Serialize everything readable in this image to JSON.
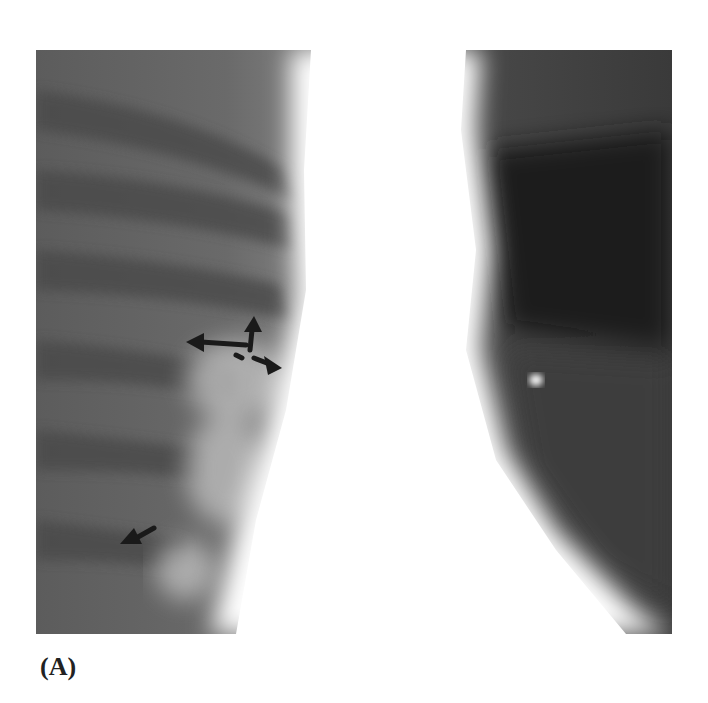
{
  "figure": {
    "panel_label": "(A)",
    "image_type": "chest radiograph",
    "annotations": [
      {
        "name": "arrow-left-hilum",
        "direction": "left"
      },
      {
        "name": "arrow-up-hilum",
        "direction": "up"
      },
      {
        "name": "arrow-down-right-hilum",
        "direction": "down-right"
      },
      {
        "name": "arrow-lower-left",
        "direction": "down-left"
      }
    ]
  }
}
